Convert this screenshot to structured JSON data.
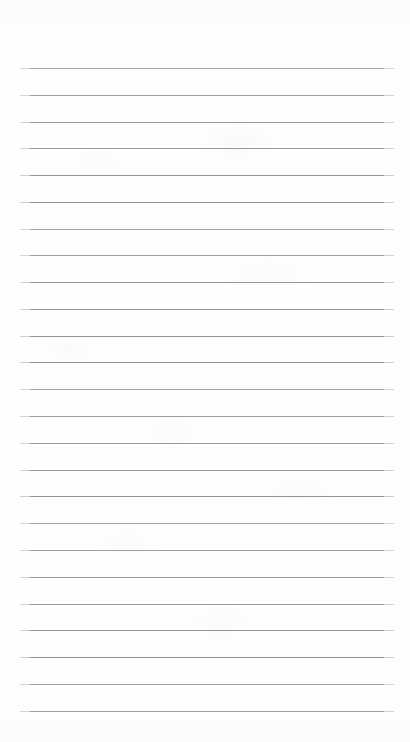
{
  "document": {
    "kind": "lined-paper-sheet",
    "title": "Blank ruled notebook page",
    "page_width": 410,
    "page_height": 742,
    "background_color": "#fefefe",
    "content_text": "",
    "has_written_content": false
  },
  "ruling": {
    "line_color": "#8d8d90",
    "line_thickness_px": 1,
    "line_count": 25,
    "line_left_x": 20,
    "line_right_x": 394,
    "line_width_px": 374,
    "first_line_y": 68,
    "last_line_y": 711,
    "line_spacing_px": 26.8,
    "top_margin_px": 68,
    "bottom_margin_px": 31,
    "left_margin_px": 20,
    "right_margin_px": 16,
    "line_y_positions": [
      68,
      95,
      122,
      148,
      175,
      202,
      229,
      255,
      282,
      309,
      336,
      362,
      389,
      416,
      443,
      470,
      496,
      523,
      550,
      577,
      604,
      630,
      657,
      684,
      711
    ]
  }
}
